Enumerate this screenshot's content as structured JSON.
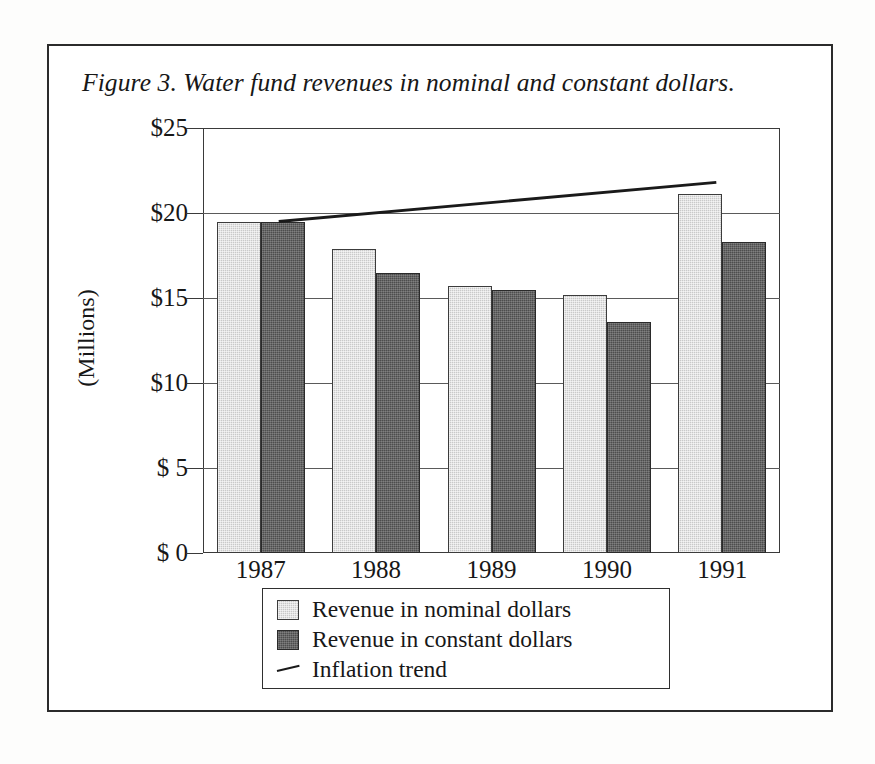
{
  "figure": {
    "title": "Figure 3. Water fund revenues in nominal and constant dollars.",
    "frame_color": "#2b2b2b"
  },
  "axes": {
    "y_axis_title": "(Millions)",
    "y_tick_labels": [
      "$25",
      "$20",
      "$15",
      "$10",
      "$ 5",
      "$ 0"
    ],
    "y_tick_values": [
      25,
      20,
      15,
      10,
      5,
      0
    ],
    "x_tick_labels": [
      "1987",
      "1988",
      "1989",
      "1990",
      "1991"
    ]
  },
  "legend": {
    "items": [
      {
        "label": "Revenue in nominal dollars",
        "marker": "square-swatch-light",
        "color": "#c9c9c9"
      },
      {
        "label": "Revenue in constant dollars",
        "marker": "square-swatch-dark",
        "color": "#4d4d4d"
      },
      {
        "label": "Inflation trend",
        "marker": "line-segment",
        "color": "#1a1a1a"
      }
    ]
  },
  "chart_data": {
    "type": "bar",
    "title": "Figure 3. Water fund revenues in nominal and constant dollars.",
    "xlabel": "",
    "ylabel": "(Millions)",
    "ylim": [
      0,
      25
    ],
    "ytick_interval": 5,
    "grid": true,
    "legend_position": "bottom",
    "categories": [
      "1987",
      "1988",
      "1989",
      "1990",
      "1991"
    ],
    "series": [
      {
        "name": "Revenue in nominal dollars",
        "type": "bar",
        "color": "#c9c9c9",
        "values": [
          19.5,
          17.9,
          15.7,
          15.2,
          21.1
        ]
      },
      {
        "name": "Revenue in constant dollars",
        "type": "bar",
        "color": "#4d4d4d",
        "values": [
          19.5,
          16.5,
          15.5,
          13.6,
          18.3
        ]
      },
      {
        "name": "Inflation trend",
        "type": "line",
        "color": "#1a1a1a",
        "x": [
          "1987",
          "1991"
        ],
        "values": [
          19.5,
          21.8
        ]
      }
    ]
  }
}
